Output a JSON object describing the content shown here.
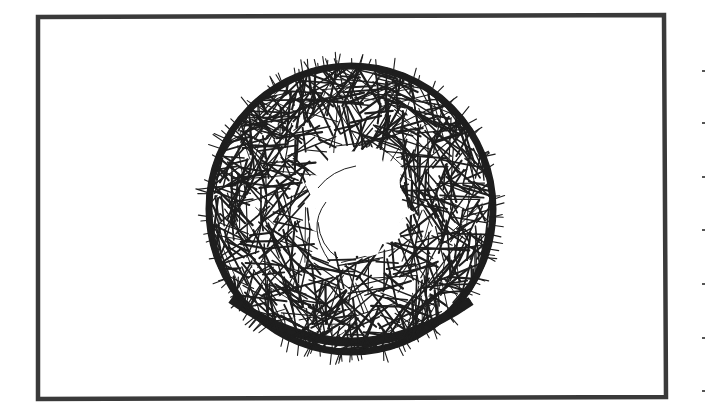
{
  "canvas": {
    "width": 705,
    "height": 406,
    "background": "#ffffff"
  },
  "frame": {
    "corners": [
      [
        38,
        17
      ],
      [
        664,
        15
      ],
      [
        666,
        397
      ],
      [
        38,
        399
      ]
    ],
    "stroke": "#3a3a3a",
    "stroke_width": 4.5
  },
  "illustration": {
    "subject": "hand-hatched ring (donut) with hairy outer edge and irregular white center",
    "ring": {
      "cx": 351,
      "cy": 209,
      "outer_rx": 145,
      "outer_ry": 146,
      "inner_r": 50,
      "inner_offset": [
        8,
        -6
      ],
      "ink": "#1e1e1e",
      "hatch_lines": 900,
      "hair_count": 120,
      "seed": 7
    },
    "inner_arcs": [
      {
        "d": "M318,188 Q332,170 356,166"
      },
      {
        "d": "M326,202 Q306,228 330,262"
      },
      {
        "d": "M318,222 Q320,246 338,258"
      }
    ],
    "inner_dot": {
      "x": 357,
      "y": 257,
      "r": 1.3
    }
  },
  "margin_ticks": {
    "x": 702,
    "ys": [
      70,
      122,
      176,
      229,
      283,
      337,
      390
    ],
    "color": "#555555"
  }
}
